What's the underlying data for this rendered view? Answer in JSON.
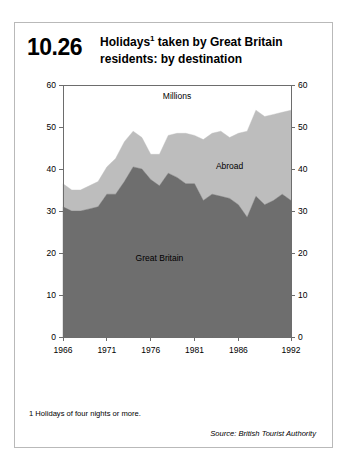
{
  "figure": {
    "number": "10.26",
    "title_line1": "Holidays",
    "title_sup": "1",
    "title_line1_rest": " taken by Great Britain",
    "title_line2": "residents: by destination",
    "title_full": "Holidays1 taken by Great Britain residents: by destination",
    "footnote": "1  Holidays of four nights or more.",
    "source": "Source: British Tourist Authority"
  },
  "colors": {
    "great_britain": "#6e6e6e",
    "abroad": "#bdbdbd",
    "plot_background": "#ffffff",
    "axis": "#6d6d6d",
    "card_border": "#b9b9b9",
    "text": "#000000"
  },
  "chart_data": {
    "type": "area",
    "stacked": true,
    "title": "Holidays1 taken by Great Britain residents: by destination",
    "units_label": "Millions",
    "xlabel": "",
    "ylabel": "Millions",
    "ylim": [
      0,
      60
    ],
    "xlim": [
      1966,
      1992
    ],
    "grid": false,
    "legend_position": "inline-annotation",
    "y_ticks": [
      0,
      10,
      20,
      30,
      40,
      50,
      60
    ],
    "y_tick_labels": [
      "0",
      "10",
      "20",
      "30",
      "40",
      "50",
      "60"
    ],
    "y_axis_both_sides": true,
    "x_ticks": [
      1966,
      1971,
      1976,
      1981,
      1986,
      1992
    ],
    "x_tick_labels": [
      "1966",
      "1971",
      "1976",
      "1981",
      "1986",
      "1992"
    ],
    "x": [
      1966,
      1967,
      1968,
      1969,
      1970,
      1971,
      1972,
      1973,
      1974,
      1975,
      1976,
      1977,
      1978,
      1979,
      1980,
      1981,
      1982,
      1983,
      1984,
      1985,
      1986,
      1987,
      1988,
      1989,
      1990,
      1991,
      1992
    ],
    "series": [
      {
        "name": "Great Britain",
        "color": "#6e6e6e",
        "label_x": 1977,
        "label_y": 18,
        "values": [
          31.0,
          30.0,
          30.0,
          30.5,
          31.0,
          34.0,
          34.0,
          37.0,
          40.5,
          40.0,
          37.5,
          36.0,
          39.0,
          38.0,
          36.5,
          36.5,
          32.5,
          34.0,
          33.5,
          33.0,
          31.5,
          28.5,
          33.5,
          31.5,
          32.5,
          34.0,
          32.5
        ]
      },
      {
        "name": "Abroad",
        "color": "#bdbdbd",
        "label_x": 1985,
        "label_y": 40,
        "values": [
          5.5,
          5.0,
          5.0,
          5.5,
          6.0,
          6.5,
          8.5,
          9.5,
          8.5,
          7.5,
          6.0,
          7.5,
          9.0,
          10.5,
          12.0,
          11.5,
          14.5,
          14.5,
          15.5,
          14.5,
          17.0,
          20.5,
          20.5,
          21.0,
          20.5,
          19.5,
          21.5
        ]
      }
    ],
    "totals": [
      36.5,
      35.0,
      35.0,
      36.0,
      37.0,
      40.5,
      42.5,
      46.5,
      49.0,
      47.5,
      43.5,
      43.5,
      48.0,
      48.5,
      48.5,
      48.0,
      47.0,
      48.5,
      49.0,
      47.5,
      48.5,
      49.0,
      54.0,
      52.5,
      53.0,
      53.5,
      54.0
    ]
  }
}
